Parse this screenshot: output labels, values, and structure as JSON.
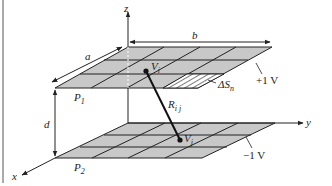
{
  "diagram": {
    "type": "parallel-plate capacitor subdivided into cells",
    "axes": {
      "x": "x",
      "y": "y",
      "z": "z"
    },
    "dimensions": {
      "width": "a",
      "length": "b",
      "separation": "d"
    },
    "plates": [
      {
        "id": "P1",
        "label": "P",
        "sub": "1",
        "potential": "+1 V",
        "position": "top"
      },
      {
        "id": "P2",
        "label": "P",
        "sub": "2",
        "potential": "−1 V",
        "position": "bottom"
      }
    ],
    "points": {
      "top": {
        "label": "V",
        "sub": "i"
      },
      "bottom": {
        "label": "V",
        "sub": "j"
      }
    },
    "distance": {
      "label": "R",
      "sub": "i j"
    },
    "element": {
      "label": "ΔS",
      "sub": "n"
    },
    "colors": {
      "plate_fill": "#c8c8c8",
      "line": "#222222",
      "background": "#ffffff"
    }
  }
}
